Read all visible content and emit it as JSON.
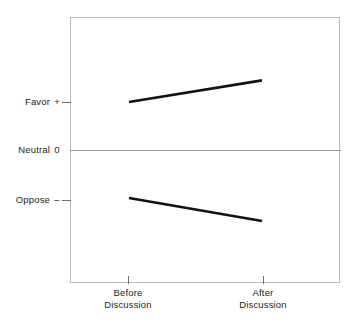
{
  "chart_data": {
    "type": "line",
    "title": "",
    "subtitle": "",
    "xlabel": "",
    "ylabel": "",
    "grid": false,
    "legend": "none",
    "categories": [
      "Before Discussion",
      "After Discussion"
    ],
    "x": [
      0,
      1
    ],
    "axis": {
      "y_tick_labels": [
        "Favor  +",
        "Neutral  0",
        "Oppose  –"
      ],
      "y_tick_values": [
        1,
        0,
        -1
      ],
      "y_reference_line": 0,
      "ylim": [
        -2.0,
        2.0
      ],
      "xlim": [
        -0.45,
        1.45
      ]
    },
    "series": [
      {
        "name": "Initially favoring group",
        "values": [
          1.0,
          1.45
        ],
        "color": "#121212",
        "direction": "increase"
      },
      {
        "name": "Initially opposing group",
        "values": [
          -1.0,
          -1.48
        ],
        "color": "#121212",
        "direction": "decrease"
      }
    ]
  },
  "yaxis": {
    "favor": {
      "label": "Favor",
      "sign": "+"
    },
    "neutral": {
      "label": "Neutral",
      "sign": "0"
    },
    "oppose": {
      "label": "Oppose",
      "sign": "–"
    }
  },
  "xaxis": {
    "before": {
      "line1": "Before",
      "line2": "Discussion"
    },
    "after": {
      "line1": "After",
      "line2": "Discussion"
    }
  },
  "colors": {
    "line": "#121212",
    "frame": "#b9b9bb",
    "zero_line": "#9a9a9c",
    "tick": "#6f6f72",
    "text": "#231f20",
    "background": "#ffffff"
  }
}
